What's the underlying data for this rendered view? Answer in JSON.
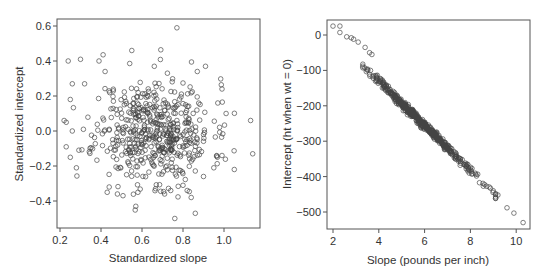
{
  "chart_data": [
    {
      "type": "scatter",
      "title": "",
      "xlabel": "Standardized slope",
      "ylabel": "Standardized intercept",
      "xlim": [
        0.19,
        1.18
      ],
      "ylim": [
        -0.55,
        0.64
      ],
      "xticks": [
        0.2,
        0.4,
        0.6,
        0.8,
        1.0
      ],
      "xtick_labels": [
        "0.2",
        "0.4",
        "0.6",
        "0.8",
        "1.0"
      ],
      "yticks": [
        -0.4,
        -0.2,
        0.0,
        0.2,
        0.4,
        0.6
      ],
      "ytick_labels": [
        "−0.4",
        "−0.2",
        "0.0",
        "0.2",
        "0.4",
        "0.6"
      ],
      "grid": false,
      "marker": "open-circle",
      "cloud": {
        "n": 520,
        "center": [
          0.66,
          0.0
        ],
        "sd": [
          0.14,
          0.15
        ],
        "corr": 0.0,
        "seed": 11
      },
      "points": [
        [
          0.77,
          0.59
        ],
        [
          0.55,
          0.46
        ],
        [
          0.24,
          0.4
        ],
        [
          0.3,
          0.41
        ],
        [
          0.39,
          0.4
        ],
        [
          0.42,
          0.34
        ],
        [
          0.66,
          0.37
        ],
        [
          0.91,
          0.37
        ],
        [
          0.87,
          0.34
        ],
        [
          0.99,
          0.24
        ],
        [
          0.26,
          0.27
        ],
        [
          0.32,
          0.27
        ],
        [
          0.25,
          0.18
        ],
        [
          0.97,
          0.16
        ],
        [
          1.01,
          0.1
        ],
        [
          1.13,
          0.06
        ],
        [
          0.22,
          0.06
        ],
        [
          0.23,
          0.05
        ],
        [
          0.26,
          0.0
        ],
        [
          0.23,
          -0.09
        ],
        [
          0.25,
          -0.15
        ],
        [
          0.28,
          -0.21
        ],
        [
          1.14,
          -0.13
        ],
        [
          1.05,
          -0.22
        ],
        [
          0.99,
          -0.14
        ],
        [
          0.44,
          -0.32
        ],
        [
          0.43,
          -0.35
        ],
        [
          0.48,
          -0.36
        ],
        [
          0.58,
          -0.35
        ],
        [
          0.57,
          -0.43
        ],
        [
          0.76,
          -0.5
        ],
        [
          0.86,
          -0.47
        ],
        [
          0.84,
          -0.38
        ],
        [
          0.74,
          -0.34
        ],
        [
          0.71,
          -0.36
        ],
        [
          0.8,
          -0.31
        ],
        [
          0.95,
          -0.21
        ],
        [
          0.9,
          -0.26
        ]
      ]
    },
    {
      "type": "scatter",
      "title": "",
      "xlabel": "Slope (pounds per inch)",
      "ylabel": "Intercept (ht when wt = 0)",
      "xlim": [
        1.8,
        10.6
      ],
      "ylim": [
        -545,
        42
      ],
      "xticks": [
        2,
        4,
        6,
        8,
        10
      ],
      "xtick_labels": [
        "2",
        "4",
        "6",
        "8",
        "10"
      ],
      "yticks": [
        -500,
        -400,
        -300,
        -200,
        -100,
        0
      ],
      "ytick_labels": [
        "−500",
        "−400",
        "−300",
        "−200",
        "−100",
        "0"
      ],
      "grid": false,
      "marker": "open-circle",
      "relationship": {
        "intercept_at_zero": 125,
        "slope": -63.5,
        "residual_sd": 6
      },
      "cloud": {
        "n": 520,
        "x_center": 5.9,
        "x_sd": 1.15,
        "seed": 7
      },
      "points": [
        [
          2.0,
          25
        ],
        [
          2.3,
          25
        ],
        [
          2.3,
          7
        ],
        [
          2.6,
          -5
        ],
        [
          2.8,
          -8
        ],
        [
          2.9,
          -12
        ],
        [
          3.1,
          -20
        ],
        [
          3.4,
          -35
        ],
        [
          3.6,
          -50
        ],
        [
          3.7,
          -55
        ],
        [
          9.0,
          -440
        ],
        [
          9.1,
          -448
        ],
        [
          9.2,
          -452
        ],
        [
          9.6,
          -488
        ],
        [
          9.9,
          -503
        ],
        [
          10.3,
          -530
        ]
      ]
    }
  ]
}
